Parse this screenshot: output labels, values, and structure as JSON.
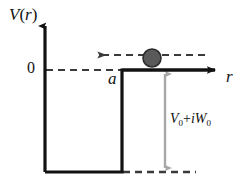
{
  "figure": {
    "type": "physics-potential-well-diagram",
    "background_color": "#ffffff"
  },
  "axes": {
    "y_axis": {
      "label_v": "V",
      "label_open_paren": "(",
      "label_arg": "r",
      "label_close_paren": ")",
      "label_full": "V (r)",
      "color": "#121212",
      "x_px": 45,
      "top_px": 20,
      "bottom_px": 172
    },
    "x_axis": {
      "label": "r",
      "color": "#121212",
      "y_px": 70,
      "start_px": 122,
      "end_px": 222
    },
    "origin_tick": {
      "label": "0",
      "y_px": 70
    }
  },
  "markers": {
    "well_radius_label": "a",
    "depth_label": {
      "v_symbol": "V",
      "v_sub": "0",
      "operator": "+",
      "i_symbol": "i",
      "w_symbol": "W",
      "w_sub": "0",
      "full": "V0+iW0"
    }
  },
  "shapes": {
    "well": {
      "left_wall_x_px": 45,
      "right_wall_x_px": 122,
      "bottom_y_px": 172,
      "top_y_px": 70,
      "line_color": "#121212",
      "line_width_px": 3
    },
    "zero_dashed_line": {
      "from_x_px": 45,
      "to_x_px": 122,
      "y_px": 70,
      "color": "#3a3a3a",
      "dash": "7 5"
    },
    "bottom_dashed_line": {
      "from_x_px": 122,
      "to_x_px": 196,
      "y_px": 172,
      "color": "#3a3a3a",
      "dash": "7 5"
    },
    "depth_arrow": {
      "x_px": 165,
      "top_y_px": 70,
      "bottom_y_px": 172,
      "color": "#a8a8a8",
      "double_headed": true
    },
    "incoming_particle_arrow": {
      "from_x_px": 205,
      "to_x_px": 95,
      "y_px": 55,
      "direction": "left",
      "color": "#3a3a3a",
      "dash": "7 5"
    },
    "particle": {
      "center_x_px": 152,
      "center_y_px": 58,
      "radius_px": 9,
      "fill_color": "#5a5a5a",
      "stroke_color": "#2b2b2b"
    }
  }
}
